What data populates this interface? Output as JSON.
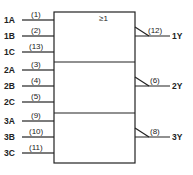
{
  "symbol": "≥1",
  "inputs": [
    {
      "name": "1A",
      "pin": "(1)"
    },
    {
      "name": "1B",
      "pin": "(2)"
    },
    {
      "name": "1C",
      "pin": "(13)"
    },
    {
      "name": "2A",
      "pin": "(3)"
    },
    {
      "name": "2B",
      "pin": "(4)"
    },
    {
      "name": "2C",
      "pin": "(5)"
    },
    {
      "name": "3A",
      "pin": "(9)"
    },
    {
      "name": "3B",
      "pin": "(10)"
    },
    {
      "name": "3C",
      "pin": "(11)"
    }
  ],
  "outputs": [
    {
      "name": "1Y",
      "pin": "(12)"
    },
    {
      "name": "2Y",
      "pin": "(6)"
    },
    {
      "name": "3Y",
      "pin": "(8)"
    }
  ]
}
